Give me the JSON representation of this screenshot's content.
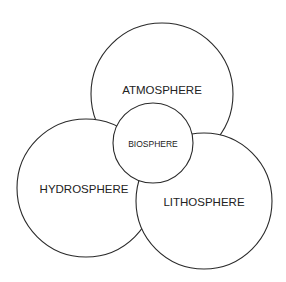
{
  "diagram": {
    "type": "venn-overlapping-circles",
    "spheres": [
      {
        "id": "atmosphere",
        "label": "ATMOSPHERE",
        "cx": 162,
        "cy": 94,
        "r": 71,
        "label_y": 91
      },
      {
        "id": "hydrosphere",
        "label": "HYDROSPHERE",
        "cx": 86,
        "cy": 188,
        "r": 69,
        "label_y": 190
      },
      {
        "id": "lithosphere",
        "label": "LITHOSPHERE",
        "cx": 204,
        "cy": 201,
        "r": 68,
        "label_y": 203
      },
      {
        "id": "biosphere",
        "label": "BIOSPHERE",
        "cx": 153,
        "cy": 143,
        "r": 40,
        "label_y": 145
      }
    ],
    "stroke_color": "#2a2a2a",
    "fill_color": "#ffffff"
  }
}
